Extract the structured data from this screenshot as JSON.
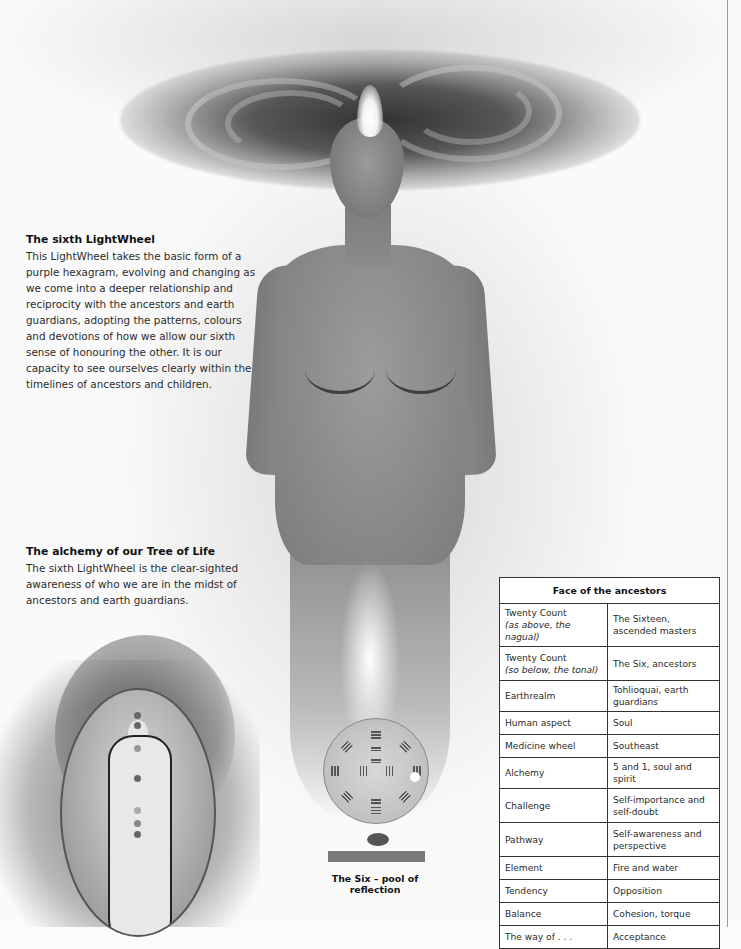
{
  "section1": {
    "heading": "The sixth LightWheel",
    "body": "This LightWheel takes the basic form of a purple hexagram, evolving and changing as we come into a deeper relationship and reciprocity with the ancestors and earth guardians, adopting the patterns, colours and devotions of how we allow our sixth sense of honouring the other. It is our capacity to see ourselves clearly within the timelines of ancestors and children."
  },
  "section2": {
    "heading": "The alchemy of our Tree of Life",
    "body": "The sixth LightWheel is the clear-sighted awareness of who we are in the midst of ancestors and earth guardians."
  },
  "images": {
    "main_figure": "meditating-figure-with-sixth-lightwheel-halo",
    "tree_of_life": "tree-of-life-egg-figure-with-chakras",
    "pool_diagram": "pool-of-reflection-hexagram-wheel"
  },
  "pool_caption": "The Six – pool of reflection",
  "table": {
    "title": "Face of the ancestors",
    "rows": [
      {
        "label": "Twenty Count",
        "sub": "(as above, the nagual)",
        "value": "The Sixteen, ascended masters"
      },
      {
        "label": "Twenty Count",
        "sub": "(so below, the tonal)",
        "value": "The Six, ancestors"
      },
      {
        "label": "Earthrealm",
        "value": "Tohlioquai, earth guardians"
      },
      {
        "label": "Human aspect",
        "value": "Soul"
      },
      {
        "label": "Medicine wheel",
        "value": "Southeast"
      },
      {
        "label": "Alchemy",
        "value": "5 and 1, soul and spirit"
      },
      {
        "label": "Challenge",
        "value": "Self-importance and self-doubt"
      },
      {
        "label": "Pathway",
        "value": "Self-awareness and perspective"
      },
      {
        "label": "Element",
        "value": "Fire and water"
      },
      {
        "label": "Tendency",
        "value": "Opposition"
      },
      {
        "label": "Balance",
        "value": "Cohesion, torque"
      },
      {
        "label": "The way of . . .",
        "value": "Acceptance"
      }
    ]
  }
}
